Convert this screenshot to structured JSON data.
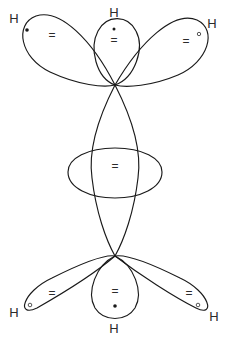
{
  "figure": {
    "background_color": "#ffffff",
    "stroke_color": "#1a1a1a",
    "text_color": "#2b2b2b",
    "width": 229,
    "height": 340
  },
  "atoms": {
    "h_symbol": "H",
    "top_left": {
      "label": "H",
      "x": 14,
      "y": 20
    },
    "top_center": {
      "label": "H",
      "x": 114,
      "y": 14
    },
    "top_right": {
      "label": "H",
      "x": 212,
      "y": 25
    },
    "bottom_left": {
      "label": "H",
      "x": 14,
      "y": 314
    },
    "bottom_center": {
      "label": "H",
      "x": 114,
      "y": 330
    },
    "bottom_right": {
      "label": "H",
      "x": 214,
      "y": 318
    }
  },
  "electron_pairs": {
    "symbol": "=",
    "top_left": {
      "symbol": "=",
      "x": 52,
      "y": 36
    },
    "top_center": {
      "symbol": "=",
      "x": 114,
      "y": 40
    },
    "top_right": {
      "symbol": "=",
      "x": 186,
      "y": 42
    },
    "center": {
      "symbol": "=",
      "x": 115,
      "y": 167
    },
    "bottom_left": {
      "symbol": "=",
      "x": 52,
      "y": 294
    },
    "bottom_center": {
      "symbol": "=",
      "x": 115,
      "y": 292
    },
    "bottom_right": {
      "symbol": "=",
      "x": 189,
      "y": 294
    }
  },
  "electron_dots": {
    "top_left": {
      "kind": "filled",
      "x": 27,
      "y": 30,
      "r": 1.8
    },
    "top_center": {
      "kind": "filled",
      "x": 114,
      "y": 29,
      "r": 1.5
    },
    "top_right": {
      "kind": "open",
      "x": 199,
      "y": 34,
      "r": 1.7
    },
    "bottom_left": {
      "kind": "open",
      "x": 30,
      "y": 305,
      "r": 1.8
    },
    "bottom_center": {
      "kind": "filled",
      "x": 115,
      "y": 306,
      "r": 1.8
    },
    "bottom_right": {
      "kind": "open",
      "x": 198,
      "y": 305,
      "r": 1.8
    }
  },
  "nodes": {
    "upper_carbon": {
      "x": 115,
      "y": 85
    },
    "lower_carbon": {
      "x": 115,
      "y": 256
    }
  },
  "lobes": [
    {
      "name": "top-left-ch-lobe",
      "d": "M 115 85 C 92 40 60 8 36 16 C 14 24 20 58 50 72 C 78 85 104 88 115 85 Z"
    },
    {
      "name": "top-center-ch-lobe",
      "d": "M 115 85 C 96 78 89 48 98 31 C 107 14 128 15 136 31 C 145 48 135 78 115 85 Z"
    },
    {
      "name": "top-right-ch-lobe",
      "d": "M 115 85 C 140 42 174 10 197 20 C 218 30 208 62 178 75 C 152 86 126 88 115 85 Z"
    },
    {
      "name": "central-cc-lobe-upper",
      "d": "M 115 85 C 97 120 88 150 92 178 C 96 212 106 240 115 256"
    },
    {
      "name": "central-cc-lobe-lower",
      "d": "M 115 85 C 133 120 142 150 138 178 C 134 212 124 240 115 256"
    },
    {
      "name": "central-overlap-oval",
      "d": "M 115 148 C 142 148 162 158 162 172 C 162 188 140 198 115 198 C 90 198 68 188 68 172 C 68 158 88 148 115 148 Z"
    },
    {
      "name": "bottom-left-ch-lobe",
      "d": "M 115 256 C 92 276 58 296 37 308 C 16 318 22 292 52 278 C 80 264 104 254 115 256 Z"
    },
    {
      "name": "bottom-center-ch-lobe",
      "d": "M 115 256 C 96 265 86 292 95 308 C 104 322 126 322 135 308 C 144 292 134 265 115 256 Z"
    },
    {
      "name": "bottom-right-ch-lobe",
      "d": "M 115 256 C 140 275 174 297 196 308 C 216 318 210 292 180 278 C 152 264 126 254 115 256 Z"
    }
  ]
}
